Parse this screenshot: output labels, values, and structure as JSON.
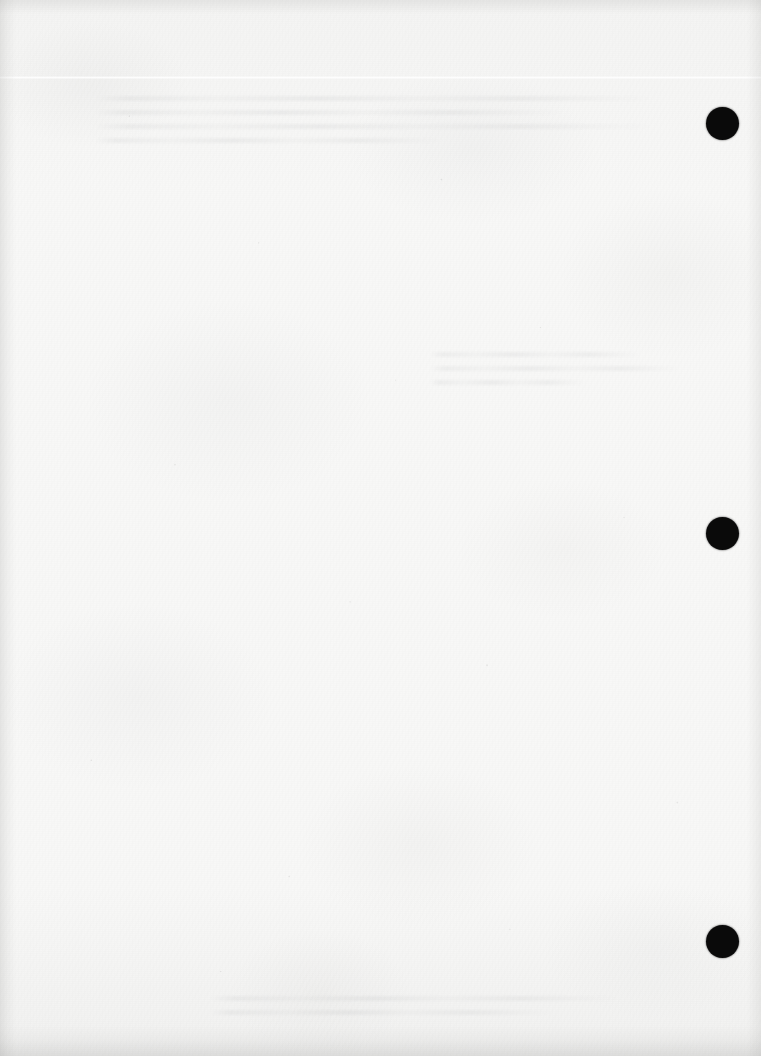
{
  "page": {
    "kind": "scanned-blank-page",
    "width": 761,
    "height": 1056,
    "visible_text": "",
    "paper_color": "#f7f7f6",
    "mark_color": "#0a0a0a"
  },
  "registration_marks": {
    "label": "registration-marks",
    "count": 3,
    "diameter": 33,
    "center_x": 722,
    "items": [
      {
        "name": "registration-mark-top",
        "cy": 123,
        "value": "1"
      },
      {
        "name": "registration-mark-middle",
        "cy": 533,
        "value": "2"
      },
      {
        "name": "registration-mark-bottom",
        "cy": 941,
        "value": "3"
      }
    ]
  },
  "artifacts": {
    "scan_seam_y": 76,
    "ghost_top": {
      "label": "show-through-top",
      "x": 95,
      "y": 96,
      "width": 560,
      "lines": [
        "full",
        "medium",
        "full",
        "short"
      ]
    },
    "ghost_middle": {
      "label": "show-through-middle",
      "x": 430,
      "y": 352,
      "width": 250,
      "lines": [
        "medium",
        "full",
        "short"
      ]
    },
    "ghost_bottom": {
      "label": "show-through-bottom",
      "x": 210,
      "y": 996,
      "width": 410,
      "lines": [
        "full",
        "medium"
      ]
    }
  }
}
